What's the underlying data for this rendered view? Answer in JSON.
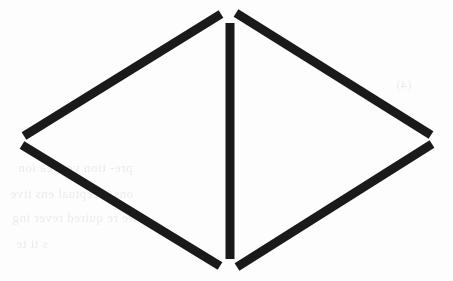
{
  "document": {
    "kind": "scanned-line-drawing",
    "title": "Bowtie / double-triangle line figure",
    "description": "A black ink line drawing on white paper: two open triangles pointing left and right, sharing a common vertical bar down the middle, forming a diamond or bowtie outline.",
    "background_color": "#fdfdfd",
    "ink_color": "#1a1a1a",
    "width": 453,
    "height": 281
  },
  "figure": {
    "name": "double-triangle-diamond",
    "stroke_color": "#1a1a1a",
    "stroke_width": 8,
    "apex_top": {
      "x": 228,
      "y": 12
    },
    "apex_bottom": {
      "x": 228,
      "y": 268
    },
    "vertex_left": {
      "x": 22,
      "y": 141
    },
    "vertex_right": {
      "x": 432,
      "y": 140
    },
    "strokes": [
      {
        "name": "upper-left-diagonal",
        "x1": 221,
        "y1": 14,
        "x2": 24,
        "y2": 136,
        "width": 9
      },
      {
        "name": "upper-right-diagonal",
        "x1": 236,
        "y1": 13,
        "x2": 431,
        "y2": 135,
        "width": 9
      },
      {
        "name": "lower-left-diagonal",
        "x1": 22,
        "y1": 145,
        "x2": 220,
        "y2": 266,
        "width": 9
      },
      {
        "name": "lower-right-diagonal",
        "x1": 432,
        "y1": 144,
        "x2": 237,
        "y2": 267,
        "width": 9
      },
      {
        "name": "center-vertical-bar",
        "x1": 230,
        "y1": 23,
        "x2": 230,
        "y2": 259,
        "width": 9
      }
    ]
  },
  "ghost_text": {
    "note": "Faint ink show-through from the reverse side of the page; mirrored and barely legible.",
    "lines": [
      {
        "text": "pre-  tion   ves  rea     ion",
        "x": 18,
        "y": 160,
        "size": 13
      },
      {
        "text": "ons    erceptual    ens tive",
        "x": 10,
        "y": 186,
        "size": 13
      },
      {
        "text": "we   re   quired   rever  ing",
        "x": 12,
        "y": 210,
        "size": 13
      },
      {
        "text": "s  ti    te",
        "x": 16,
        "y": 236,
        "size": 13
      },
      {
        "text": "(4)",
        "x": 396,
        "y": 78,
        "size": 12
      }
    ]
  }
}
